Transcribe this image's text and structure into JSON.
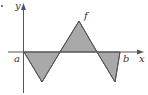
{
  "diagram": {
    "type": "signed-area-graph",
    "labels": {
      "y_axis": "y",
      "x_axis": "x",
      "function": "f",
      "left_bound": "a",
      "right_bound": "b"
    },
    "colors": {
      "fill": "#a9a9a9",
      "stroke": "#555555",
      "axis": "#555555",
      "text": "#333333"
    },
    "polygon_points": "24,52 42,82 60,52 79,21 97,52 115,82 120,52"
  }
}
